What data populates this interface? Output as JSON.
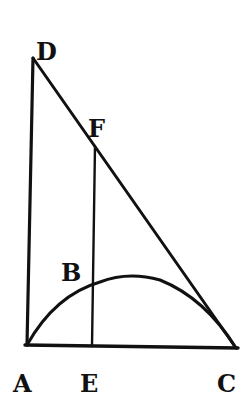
{
  "diagram": {
    "type": "geometric-figure",
    "stroke_color": "#111111",
    "background": "#ffffff",
    "points": {
      "D": {
        "label": "D",
        "x": 33,
        "y": 58
      },
      "A": {
        "label": "A",
        "x": 27,
        "y": 345
      },
      "C": {
        "label": "C",
        "x": 236,
        "y": 348
      },
      "E": {
        "label": "E",
        "x": 92,
        "y": 346
      },
      "F": {
        "label": "F",
        "x": 95,
        "y": 146
      },
      "B": {
        "label": "B",
        "x": 92,
        "y": 288
      }
    },
    "labels": [
      {
        "name": "D",
        "text": "D",
        "x": 36,
        "y": 60
      },
      {
        "name": "F",
        "text": "F",
        "x": 88,
        "y": 137
      },
      {
        "name": "B",
        "text": "B",
        "x": 61,
        "y": 281
      },
      {
        "name": "A",
        "text": "A",
        "x": 13,
        "y": 392
      },
      {
        "name": "E",
        "text": "E",
        "x": 80,
        "y": 392
      },
      {
        "name": "C",
        "text": "C",
        "x": 217,
        "y": 392
      }
    ],
    "segments": [
      "DA",
      "DC",
      "AC",
      "FE"
    ],
    "curves": [
      "arc A-B-C (parabolic)"
    ]
  }
}
